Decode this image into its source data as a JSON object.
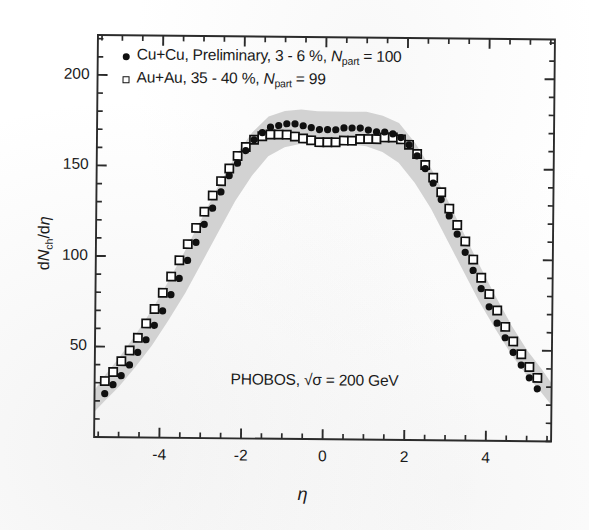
{
  "figure": {
    "annotation": "PHOBOS, √σ = 200 GeV",
    "xlabel": "η",
    "ylabel_pre": "d",
    "ylabel_n": "N",
    "ylabel_sub": "ch",
    "ylabel_post": "/d",
    "ylabel_eta": "η"
  },
  "legend": {
    "entries": [
      {
        "marker": "filled-circle",
        "text_a": "Cu+Cu, Preliminary, 3 - 6 %, ",
        "text_n": "N",
        "text_sub": "part",
        "text_b": " = 100"
      },
      {
        "marker": "open-square",
        "text_a": "Au+Au, 35 - 40 %, ",
        "text_n": "N",
        "text_sub": "part",
        "text_b": " = 99"
      }
    ]
  },
  "axes": {
    "x_ticks": [
      "-4",
      "-2",
      "0",
      "2",
      "4"
    ],
    "y_ticks": [
      "50",
      "100",
      "150",
      "200"
    ]
  },
  "colors": {
    "marker": "#101010",
    "band": "#d2d2d2",
    "frame": "#2b2b2b",
    "background": "#ffffff"
  },
  "chart_data": {
    "type": "scatter",
    "title": "",
    "subtitle": "",
    "xlabel": "η",
    "ylabel": "dNch/dη",
    "xlim": [
      -5.6,
      5.6
    ],
    "ylim": [
      0,
      222
    ],
    "x_major_ticks": [
      -4,
      -2,
      0,
      2,
      4
    ],
    "y_major_ticks": [
      50,
      100,
      150,
      200
    ],
    "x_minor_tick_step": 0.5,
    "y_minor_tick_step": 10,
    "grid": false,
    "legend_position": "top-left",
    "annotations": [
      "PHOBOS, √σ = 200 GeV"
    ],
    "series": [
      {
        "name": "Cu+Cu, Preliminary, 3 - 6 %, Npart = 100",
        "marker": "filled-circle",
        "color": "#101010",
        "x": [
          -5.35,
          -5.15,
          -4.95,
          -4.75,
          -4.55,
          -4.35,
          -4.15,
          -3.95,
          -3.75,
          -3.55,
          -3.35,
          -3.15,
          -2.95,
          -2.75,
          -2.55,
          -2.35,
          -2.15,
          -1.95,
          -1.75,
          -1.55,
          -1.35,
          -1.15,
          -0.95,
          -0.75,
          -0.55,
          -0.35,
          -0.15,
          0.05,
          0.25,
          0.45,
          0.65,
          0.85,
          1.05,
          1.25,
          1.45,
          1.65,
          1.85,
          2.05,
          2.25,
          2.45,
          2.65,
          2.85,
          3.05,
          3.25,
          3.45,
          3.65,
          3.85,
          4.05,
          4.25,
          4.45,
          4.65,
          4.85,
          5.05,
          5.25
        ],
        "y": [
          24,
          29,
          34,
          40,
          47,
          54,
          62,
          70,
          79,
          88,
          98,
          108,
          118,
          127,
          136,
          145,
          152,
          159,
          165,
          169,
          172,
          173,
          174,
          174,
          173,
          172,
          171,
          171,
          171,
          172,
          172,
          172,
          171,
          170,
          170,
          169,
          167,
          163,
          157,
          150,
          142,
          133,
          124,
          114,
          104,
          94,
          84,
          74,
          65,
          57,
          49,
          42,
          35,
          29
        ]
      },
      {
        "name": "Au+Au, 35 - 40 %, Npart = 99",
        "marker": "open-square",
        "color": "#101010",
        "x": [
          -5.35,
          -5.15,
          -4.95,
          -4.75,
          -4.55,
          -4.35,
          -4.15,
          -3.95,
          -3.75,
          -3.55,
          -3.35,
          -3.15,
          -2.95,
          -2.75,
          -2.55,
          -2.35,
          -2.15,
          -1.95,
          -1.75,
          -1.55,
          -1.35,
          -1.15,
          -0.95,
          -0.75,
          -0.55,
          -0.35,
          -0.15,
          0.05,
          0.25,
          0.45,
          0.65,
          0.85,
          1.05,
          1.25,
          1.45,
          1.65,
          1.85,
          2.05,
          2.25,
          2.45,
          2.65,
          2.85,
          3.05,
          3.25,
          3.45,
          3.65,
          3.85,
          4.05,
          4.25,
          4.45,
          4.65,
          4.85,
          5.05,
          5.25
        ],
        "y": [
          31,
          36,
          42,
          48,
          55,
          63,
          71,
          80,
          89,
          98,
          107,
          116,
          125,
          134,
          142,
          149,
          156,
          161,
          165,
          167,
          168,
          168,
          168,
          167,
          166,
          165,
          164,
          164,
          164,
          165,
          165,
          166,
          166,
          166,
          167,
          167,
          166,
          163,
          158,
          152,
          145,
          137,
          128,
          119,
          110,
          100,
          90,
          81,
          72,
          63,
          55,
          48,
          41,
          35
        ]
      }
    ],
    "error_band": {
      "name": "systematic uncertainty band",
      "color": "#d2d2d2",
      "x": [
        -5.6,
        -5.35,
        -5.0,
        -4.6,
        -4.2,
        -3.8,
        -3.4,
        -3.0,
        -2.6,
        -2.2,
        -1.8,
        -1.4,
        -1.0,
        -0.6,
        -0.2,
        0.2,
        0.6,
        1.0,
        1.4,
        1.8,
        2.2,
        2.6,
        3.0,
        3.4,
        3.8,
        4.2,
        4.6,
        5.0,
        5.35,
        5.6
      ],
      "y_upper": [
        26,
        34,
        44,
        57,
        71,
        87,
        104,
        122,
        140,
        156,
        169,
        178,
        181,
        182,
        181,
        181,
        181,
        181,
        179,
        175,
        164,
        150,
        133,
        115,
        97,
        80,
        64,
        50,
        40,
        32
      ],
      "y_lower": [
        14,
        20,
        28,
        39,
        51,
        65,
        80,
        97,
        114,
        131,
        145,
        156,
        161,
        163,
        163,
        163,
        163,
        162,
        159,
        153,
        142,
        128,
        111,
        94,
        77,
        62,
        48,
        36,
        27,
        20
      ]
    }
  }
}
